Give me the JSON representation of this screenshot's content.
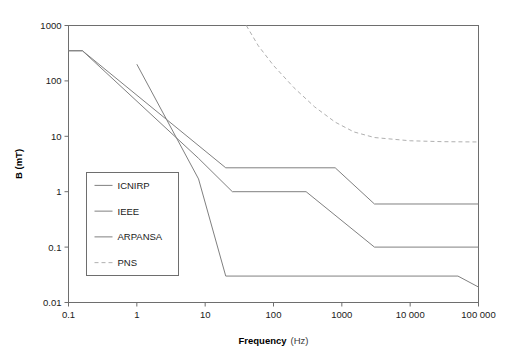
{
  "chart_data": {
    "type": "line",
    "title": "",
    "xlabel": "Frequency",
    "xlabel_unit": "(Hz)",
    "ylabel": "B (mT)",
    "xscale": "log",
    "yscale": "log",
    "xlim": [
      0.1,
      100000
    ],
    "ylim": [
      0.01,
      1000
    ],
    "grid": false,
    "legend_position": "center-left",
    "xticks": [
      0.1,
      1,
      10,
      100,
      1000,
      10000,
      100000
    ],
    "xtick_labels": [
      "0.1",
      "1",
      "10",
      "100",
      "1000",
      "10 000",
      "100 000"
    ],
    "yticks": [
      0.01,
      0.1,
      1,
      10,
      100,
      1000
    ],
    "ytick_labels": [
      "0.01",
      "0.1",
      "1",
      "10",
      "100",
      "1000"
    ],
    "series": [
      {
        "name": "ICNIRP",
        "style": "solid",
        "color": "#808080",
        "points": [
          [
            0.1,
            350
          ],
          [
            0.16,
            350
          ],
          [
            8,
            4.0
          ],
          [
            25,
            1.0
          ],
          [
            300,
            1.0
          ],
          [
            3000,
            0.1
          ],
          [
            100000,
            0.1
          ]
        ]
      },
      {
        "name": "IEEE",
        "style": "solid",
        "color": "#808080",
        "points": [
          [
            1,
            200
          ],
          [
            8,
            1.7
          ],
          [
            20,
            0.03
          ],
          [
            50000,
            0.03
          ],
          [
            100000,
            0.019
          ]
        ]
      },
      {
        "name": "ARPANSA",
        "style": "solid",
        "color": "#808080",
        "points": [
          [
            0.1,
            350
          ],
          [
            0.16,
            350
          ],
          [
            20,
            2.7
          ],
          [
            800,
            2.7
          ],
          [
            3000,
            0.6
          ],
          [
            100000,
            0.6
          ]
        ]
      },
      {
        "name": "PNS",
        "style": "dashed",
        "color": "#b0b0b0",
        "points": [
          [
            40,
            1000
          ],
          [
            60,
            430
          ],
          [
            100,
            190
          ],
          [
            200,
            75
          ],
          [
            400,
            34
          ],
          [
            800,
            18
          ],
          [
            1500,
            12
          ],
          [
            3000,
            9.5
          ],
          [
            10000,
            8.3
          ],
          [
            30000,
            8.0
          ],
          [
            100000,
            7.9
          ]
        ]
      }
    ],
    "legend_entries": [
      "ICNIRP",
      "IEEE",
      "ARPANSA",
      "PNS"
    ]
  }
}
